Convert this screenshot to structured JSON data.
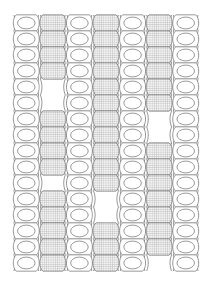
{
  "figure": {
    "title": "Cross-sectional structure diagram",
    "caption": "",
    "canvas": {
      "width": 211,
      "height": 284,
      "background": "#ffffff"
    },
    "plot_area": {
      "x": 13,
      "y": 15,
      "width": 186,
      "height": 255
    }
  },
  "style": {
    "stroke_color": "#6e6e6e",
    "stroke_width": 0.7,
    "fill_empty": "#ffffff",
    "hatch_color": "#a8a8a8",
    "hatch_tint": "#f2f2f2",
    "hatch_spacing": 2.2
  },
  "chart_data": {
    "type": "diagram",
    "title": "Cross-sectional structure diagram",
    "xlabel": "",
    "ylabel": "",
    "grid": false,
    "legend": [],
    "column_count": 7,
    "column_width": 26.57,
    "cell_height": 16.0,
    "columns": [
      {
        "index": 0,
        "fill": "empty",
        "x": 13.0,
        "label": "column-1-empty",
        "cell_count": 16,
        "gaps": []
      },
      {
        "index": 1,
        "fill": "hatched",
        "x": 39.57,
        "label": "column-2-hatched",
        "cell_count": 16,
        "gaps": [
          {
            "start_cell": 4,
            "end_cell": 5
          },
          {
            "start_cell": 10,
            "end_cell": 10
          }
        ]
      },
      {
        "index": 2,
        "fill": "empty",
        "x": 66.14,
        "label": "column-3-empty",
        "cell_count": 16,
        "gaps": []
      },
      {
        "index": 3,
        "fill": "hatched",
        "x": 92.71,
        "label": "column-4-hatched",
        "cell_count": 16,
        "gaps": [
          {
            "start_cell": 11,
            "end_cell": 12
          }
        ]
      },
      {
        "index": 4,
        "fill": "empty",
        "x": 119.29,
        "label": "column-5-empty",
        "cell_count": 16,
        "gaps": []
      },
      {
        "index": 5,
        "fill": "hatched",
        "x": 145.86,
        "label": "column-6-hatched",
        "cell_count": 16,
        "gaps": [
          {
            "start_cell": 6,
            "end_cell": 7
          },
          {
            "start_cell": 15,
            "end_cell": 15
          }
        ]
      },
      {
        "index": 6,
        "fill": "empty",
        "x": 172.43,
        "label": "column-7-empty",
        "cell_count": 16,
        "gaps": []
      }
    ]
  }
}
